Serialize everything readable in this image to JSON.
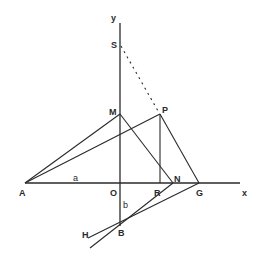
{
  "diagram": {
    "title": "",
    "axes": {
      "x_label": "x",
      "y_label": "y"
    },
    "points": {
      "A": {
        "label": "A",
        "x": 25,
        "y": 183
      },
      "O": {
        "label": "O",
        "x": 120,
        "y": 183
      },
      "S": {
        "label": "S",
        "x": 120,
        "y": 45
      },
      "M": {
        "label": "M",
        "x": 120,
        "y": 114
      },
      "P": {
        "label": "P",
        "x": 160,
        "y": 114
      },
      "R": {
        "label": "R",
        "x": 160,
        "y": 183
      },
      "N": {
        "label": "N",
        "x": 173,
        "y": 183
      },
      "G": {
        "label": "G",
        "x": 199,
        "y": 183
      },
      "B": {
        "label": "B",
        "x": 120,
        "y": 225
      },
      "H": {
        "label": "H",
        "x": 88,
        "y": 240
      }
    },
    "segment_labels": {
      "a": "a",
      "b": "b"
    },
    "segments": [
      {
        "from": "A",
        "to": "x-axis-end",
        "style": "solid",
        "note": "x-axis"
      },
      {
        "from": "B",
        "to": "y-axis-top",
        "style": "solid",
        "note": "y-axis"
      },
      {
        "from": "A",
        "to": "M",
        "style": "solid"
      },
      {
        "from": "A",
        "to": "P",
        "style": "solid"
      },
      {
        "from": "M",
        "to": "N",
        "style": "solid"
      },
      {
        "from": "P",
        "to": "R",
        "style": "solid"
      },
      {
        "from": "P",
        "to": "G",
        "style": "solid"
      },
      {
        "from": "S",
        "to": "P",
        "style": "dashed"
      },
      {
        "from": "G",
        "to": "H",
        "style": "solid",
        "note": "through B"
      },
      {
        "from": "N",
        "to": "beyond-B",
        "style": "solid",
        "note": "through B"
      }
    ]
  }
}
